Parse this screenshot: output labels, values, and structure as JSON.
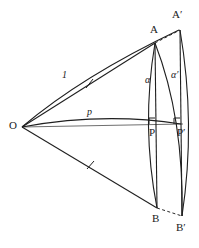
{
  "figure": {
    "type": "geometry-diagram",
    "background_color": "#ffffff",
    "stroke_color": "#1a1a1a",
    "axis_color": "#6b6b6b",
    "points": {
      "O": {
        "label": "O",
        "x": 22,
        "y": 127
      },
      "A": {
        "label": "A",
        "x": 155,
        "y": 43
      },
      "Ap": {
        "label": "A′",
        "x": 179,
        "y": 30
      },
      "P": {
        "label": "P",
        "x": 155,
        "y": 124
      },
      "Pp": {
        "label": "P′",
        "x": 180,
        "y": 124
      },
      "B": {
        "label": "B",
        "x": 157,
        "y": 208
      },
      "Bp": {
        "label": "B′",
        "x": 180,
        "y": 215
      }
    },
    "labels": [
      {
        "name": "segment-label-one",
        "text": "1",
        "x": 62,
        "y": 73,
        "style": "seg"
      },
      {
        "name": "segment-label-p",
        "text": "p",
        "x": 88,
        "y": 110,
        "style": "seg"
      },
      {
        "name": "angle-label-alpha",
        "text": "α",
        "x": 146,
        "y": 78,
        "style": "ang"
      },
      {
        "name": "angle-label-alpha-prime",
        "text": "α′",
        "x": 172,
        "y": 73,
        "style": "ang"
      },
      {
        "name": "point-label-O",
        "text": "O",
        "x": 9,
        "y": 120,
        "style": "pt"
      },
      {
        "name": "point-label-A",
        "text": "A",
        "x": 150,
        "y": 24,
        "style": "pt"
      },
      {
        "name": "point-label-A-prime",
        "text": "A′",
        "x": 172,
        "y": 9,
        "style": "pt"
      },
      {
        "name": "point-label-P",
        "text": "P",
        "x": 150,
        "y": 128,
        "style": "pt"
      },
      {
        "name": "point-label-P-prime",
        "text": "P′",
        "x": 178,
        "y": 128,
        "style": "pt"
      },
      {
        "name": "point-label-B",
        "text": "B",
        "x": 153,
        "y": 214,
        "style": "pt"
      },
      {
        "name": "point-label-B-prime",
        "text": "B′",
        "x": 176,
        "y": 222,
        "style": "pt"
      }
    ],
    "tick_marks": [
      {
        "name": "tick-on-OA",
        "x": 89,
        "y": 83
      },
      {
        "name": "tick-on-OB",
        "x": 90,
        "y": 165
      }
    ],
    "right_angles": [
      {
        "name": "right-angle-at-P",
        "x": 155,
        "y": 124
      },
      {
        "name": "right-angle-at-P-prime",
        "x": 180,
        "y": 124
      }
    ]
  }
}
